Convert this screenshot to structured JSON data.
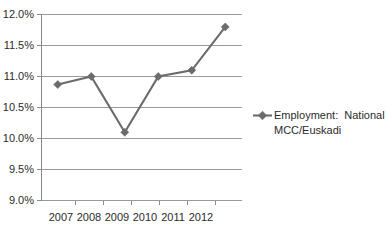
{
  "chart_data": {
    "type": "line",
    "title": "",
    "subtitle": "",
    "xlabel": "",
    "ylabel": "",
    "categories": [
      "2007",
      "2008",
      "2009",
      "2010",
      "2011",
      "2012"
    ],
    "series": [
      {
        "name": "Employment:  National MCC/Euskadi",
        "values": [
          10.87,
          11.0,
          10.1,
          11.0,
          11.1,
          11.8
        ],
        "color": "#6b6b6b",
        "marker": "diamond"
      }
    ],
    "ylim": [
      9.0,
      12.0
    ],
    "ytick_step": 0.5,
    "ytick_labels": [
      "12.0%",
      "11.5%",
      "11.0%",
      "10.5%",
      "10.0%",
      "9.5%",
      "9.0%"
    ],
    "ytick_values": [
      12.0,
      11.5,
      11.0,
      10.5,
      10.0,
      9.5,
      9.0
    ],
    "xtick_labels": [
      "2007",
      "2008",
      "2009",
      "2010",
      "2011",
      "2012"
    ],
    "grid": "horizontal",
    "legend_position": "right",
    "legend_entries": [
      {
        "line1": "Employment:  National",
        "line2": "MCC/Euskadi",
        "color": "#6b6b6b"
      }
    ],
    "value_suffix": "%",
    "background_color": "#ffffff",
    "gridline_color": "#9a9a9a",
    "axis_color": "#8a8a8a",
    "text_color": "#2b2b2b"
  }
}
